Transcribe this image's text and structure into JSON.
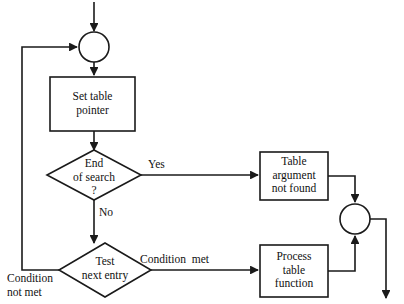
{
  "diagram": {
    "background_color": "#ffffff",
    "line_color": "#1a1a1a",
    "text_color": "#111111"
  },
  "nodes": {
    "entry_arrow": {
      "name": "entry-arrow"
    },
    "junction_top": {
      "name": "junction-circle-top"
    },
    "set_table_pointer": {
      "label": "Set table\npointer"
    },
    "end_of_search": {
      "label": "End\nof search\n?"
    },
    "test_next_entry": {
      "label": "Test\nnext entry"
    },
    "table_argument_not_found": {
      "label": "Table\nargument\nnot found"
    },
    "process_table_function": {
      "label": "Process\ntable\nfunction"
    },
    "junction_right": {
      "name": "junction-circle-right"
    },
    "exit_arrow": {
      "name": "exit-arrow"
    }
  },
  "edge_labels": {
    "yes": "Yes",
    "no": "No",
    "condition_met": "Condition  met",
    "condition_not_met": "Condition\nnot met"
  }
}
